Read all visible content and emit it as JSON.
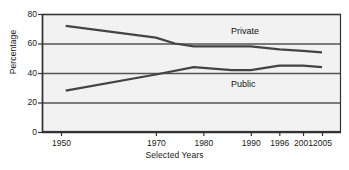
{
  "chart_data": {
    "type": "line",
    "title": "",
    "xlabel": "Selected Years",
    "ylabel": "Percentage",
    "x": [
      1950,
      1970,
      1980,
      1990,
      1996,
      2001,
      2005
    ],
    "xtick_labels": [
      "1950",
      "1970",
      "1980",
      "1990",
      "1996",
      "2001",
      "2005"
    ],
    "ytick_labels": [
      "0",
      "20",
      "40",
      "60",
      "80"
    ],
    "yticks": [
      0,
      20,
      40,
      60,
      80
    ],
    "ylim": [
      0,
      80
    ],
    "grid": true,
    "legend_position": "inline-annotation",
    "series": [
      {
        "name": "Private",
        "color": "#444444",
        "annotation": "Private",
        "points": [
          {
            "x": 1951,
            "y": 72
          },
          {
            "x": 1970,
            "y": 64
          },
          {
            "x": 1974,
            "y": 60
          },
          {
            "x": 1978,
            "y": 58
          },
          {
            "x": 1990,
            "y": 58
          },
          {
            "x": 1996,
            "y": 56
          },
          {
            "x": 2001,
            "y": 55
          },
          {
            "x": 2005,
            "y": 54
          }
        ]
      },
      {
        "name": "Public",
        "color": "#444444",
        "annotation": "Public",
        "points": [
          {
            "x": 1951,
            "y": 28
          },
          {
            "x": 1970,
            "y": 39
          },
          {
            "x": 1978,
            "y": 44
          },
          {
            "x": 1986,
            "y": 42
          },
          {
            "x": 1990,
            "y": 42
          },
          {
            "x": 1996,
            "y": 45
          },
          {
            "x": 2001,
            "y": 45
          },
          {
            "x": 2005,
            "y": 44
          }
        ]
      }
    ]
  },
  "annotations": {
    "private_label": "Private",
    "public_label": "Public"
  },
  "colors": {
    "line": "#444444",
    "gridline": "#555555",
    "axis": "#333333",
    "plot_background": "#f2f2f2",
    "page_background": "#ffffff",
    "text": "#1a1a1a"
  }
}
